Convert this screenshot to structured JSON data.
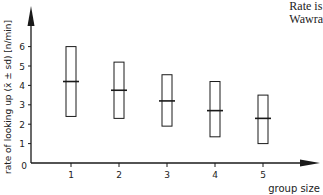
{
  "corner_text": {
    "line1": "Rate is",
    "line2": "Wawra"
  },
  "chart_data": {
    "type": "box",
    "title": "",
    "xlabel": "group size",
    "ylabel": "rate of looking up (x̄ ± sd) [n/min]",
    "categories": [
      "1",
      "2",
      "3",
      "4",
      "5"
    ],
    "series": [
      {
        "name": "mean ± sd",
        "mean": [
          4.2,
          3.75,
          3.2,
          2.7,
          2.3
        ],
        "upper": [
          6.0,
          5.2,
          4.55,
          4.2,
          3.5
        ],
        "lower": [
          2.4,
          2.3,
          1.9,
          1.35,
          1.0
        ]
      }
    ],
    "x_ticks": [
      "1",
      "2",
      "3",
      "4",
      "5"
    ],
    "y_ticks": [
      "0",
      "1",
      "2",
      "3",
      "4",
      "5",
      "6"
    ],
    "ylim": [
      0,
      7
    ],
    "grid": false,
    "legend": "none"
  }
}
